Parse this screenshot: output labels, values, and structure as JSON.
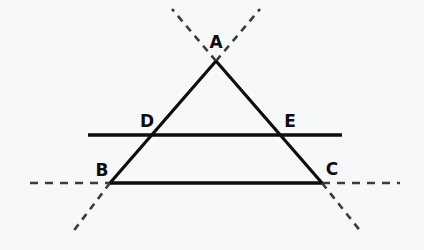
{
  "figure": {
    "background_color": "#f7f8fa",
    "stroke_color": "#0d0d0f",
    "dashed_color": "#3a3a40",
    "width": 424,
    "height": 250
  },
  "labels": {
    "a": "A",
    "b": "B",
    "c": "C",
    "d": "D",
    "e": "E"
  },
  "label_positions": {
    "a": {
      "x": 216,
      "y": 48
    },
    "b": {
      "x": 102,
      "y": 176
    },
    "c": {
      "x": 332,
      "y": 175
    },
    "d": {
      "x": 147,
      "y": 127
    },
    "e": {
      "x": 290,
      "y": 127
    }
  },
  "points": {
    "A": {
      "x": 216,
      "y": 61
    },
    "B": {
      "x": 110,
      "y": 183
    },
    "C": {
      "x": 322,
      "y": 183
    },
    "D": {
      "x": 152,
      "y": 135
    },
    "E": {
      "x": 280,
      "y": 135
    }
  },
  "segments": {
    "side_ab": {
      "name": "AB",
      "x1": 216,
      "y1": 61,
      "x2": 110,
      "y2": 183,
      "style": "solid",
      "width": 3.2
    },
    "side_ac": {
      "name": "AC",
      "x1": 216,
      "y1": 61,
      "x2": 322,
      "y2": 183,
      "style": "solid",
      "width": 3.2
    },
    "base_bc": {
      "name": "BC",
      "x1": 110,
      "y1": 183,
      "x2": 322,
      "y2": 183,
      "style": "solid",
      "width": 3.4
    },
    "transversal_de": {
      "name": "line through D and E",
      "x1": 88,
      "y1": 135,
      "x2": 342,
      "y2": 135,
      "style": "solid",
      "width": 3.4
    }
  },
  "dashed_extensions": {
    "ab_beyond_a": {
      "name": "AB extended beyond A",
      "x1": 216,
      "y1": 61,
      "x2": 260,
      "y2": 9
    },
    "ac_beyond_a": {
      "name": "AC extended beyond A",
      "x1": 216,
      "y1": 61,
      "x2": 172,
      "y2": 9
    },
    "ab_beyond_b": {
      "name": "AB extended beyond B",
      "x1": 110,
      "y1": 183,
      "x2": 72,
      "y2": 233
    },
    "ac_beyond_c": {
      "name": "AC extended beyond C",
      "x1": 322,
      "y1": 183,
      "x2": 362,
      "y2": 233
    },
    "bc_left": {
      "name": "BC extended left of B",
      "x1": 30,
      "y1": 183,
      "x2": 110,
      "y2": 183
    },
    "bc_right": {
      "name": "BC extended right of C",
      "x1": 322,
      "y1": 183,
      "x2": 400,
      "y2": 183
    }
  },
  "dash_pattern": {
    "diagonal": "7 6",
    "horizontal": "8 7",
    "width": 2.6
  }
}
